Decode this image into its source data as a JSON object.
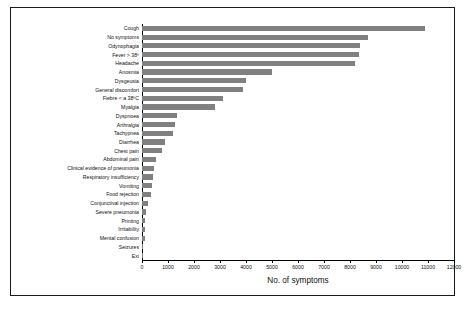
{
  "figure": {
    "kind": "horizontal-bar-chart",
    "background_color": "#ffffff",
    "frame_color": "#1a1a1a",
    "bar_color": "#808080"
  },
  "chart_data": {
    "type": "bar",
    "orientation": "horizontal",
    "title": "",
    "xlabel": "No. of symptoms",
    "ylabel": "",
    "xlim": [
      0,
      12000
    ],
    "ylim": null,
    "grid": false,
    "legend": null,
    "xticks": [
      0,
      1000,
      2000,
      3000,
      4000,
      5000,
      6000,
      7000,
      8000,
      9000,
      10000,
      11000,
      12000
    ],
    "xtick_labels": [
      "0",
      "1000",
      "2000",
      "3000",
      "4000",
      "5000",
      "6000",
      "7000",
      "8000",
      "9000",
      "10000",
      "11000",
      "12000"
    ],
    "categories": [
      "Cough",
      "No symptoms",
      "Odynophagia",
      "Fever > 38º",
      "Headache",
      "Anosmia",
      "Dysgeusia",
      "General discomfort",
      "Fiebre < a 38ºC",
      "Myalgia",
      "Dyspnoea",
      "Arthralgia",
      "Tachypnea",
      "Diarrhea",
      "Chest pain",
      "Abdominal pain",
      "Clinical evidence of pneumonia",
      "Respiratory insufficiency",
      "Vomiting",
      "Food rejection",
      "Conjunctival injection",
      "Severe pneumonia",
      "Printing",
      "Irritability",
      "Mental confusion",
      "Seizures",
      "Exi"
    ],
    "values": [
      10900,
      8700,
      8400,
      8350,
      8200,
      5000,
      4000,
      3900,
      3100,
      2800,
      1350,
      1250,
      1200,
      900,
      780,
      530,
      460,
      430,
      400,
      330,
      240,
      140,
      130,
      120,
      110,
      40,
      20
    ]
  }
}
